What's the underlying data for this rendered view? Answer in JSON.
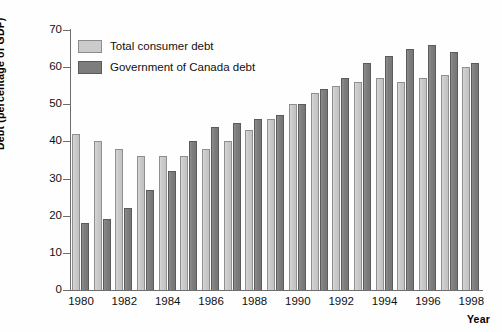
{
  "chart_data": {
    "type": "bar",
    "title": "",
    "xlabel": "Year",
    "ylabel": "Debt (percentage of GDP)",
    "ylim": [
      0,
      70
    ],
    "ytick_values": [
      0,
      10,
      20,
      30,
      40,
      50,
      60,
      70
    ],
    "ytick_labels": [
      "0",
      "10",
      "20",
      "30",
      "40",
      "50",
      "60",
      "70"
    ],
    "grid": false,
    "legend_position": "upper left",
    "categories": [
      "1980",
      "1981",
      "1982",
      "1983",
      "1984",
      "1985",
      "1986",
      "1987",
      "1988",
      "1989",
      "1990",
      "1991",
      "1992",
      "1993",
      "1994",
      "1995",
      "1996",
      "1997",
      "1998"
    ],
    "xtick_labels": [
      "1980",
      "1982",
      "1984",
      "1986",
      "1988",
      "1990",
      "1992",
      "1994",
      "1996",
      "1998"
    ],
    "series": [
      {
        "name": "Total consumer debt",
        "color": "#cbcbcb",
        "values": [
          42,
          40,
          38,
          36,
          36,
          36,
          38,
          40,
          43,
          46,
          50,
          53,
          55,
          56,
          57,
          56,
          57,
          58,
          60
        ]
      },
      {
        "name": "Government of Canada debt",
        "color": "#7d7d7d",
        "values": [
          18,
          19,
          22,
          27,
          32,
          40,
          44,
          45,
          46,
          47,
          50,
          54,
          57,
          61,
          63,
          65,
          66,
          64,
          61
        ]
      }
    ]
  },
  "legend": {
    "items": [
      {
        "label": "Total consumer debt"
      },
      {
        "label": "Government of Canada debt"
      }
    ]
  },
  "axes": {
    "y_title": "Debt (percentage of GDP)",
    "x_title": "Year"
  }
}
